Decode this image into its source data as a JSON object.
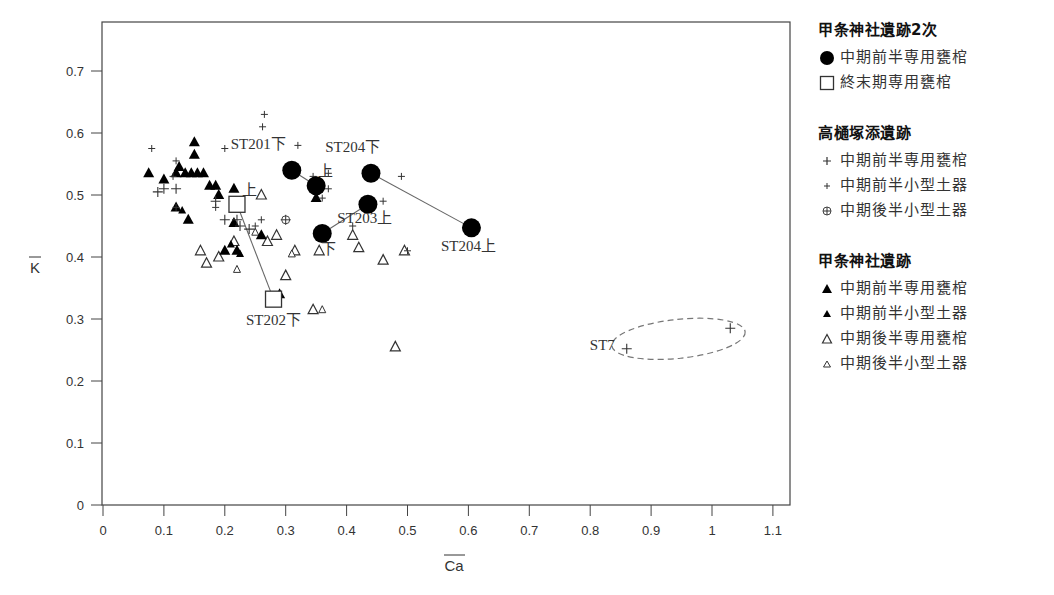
{
  "chart_data": {
    "type": "scatter",
    "title": "",
    "xlabel": "Ca",
    "ylabel": "K",
    "xlim": [
      0,
      1.17
    ],
    "ylim": [
      0,
      0.78
    ],
    "x_ticks": [
      "0",
      "0.1",
      "0.2",
      "0.3",
      "0.4",
      "0.5",
      "0.6",
      "0.7",
      "0.8",
      "0.9",
      "1",
      "1.1"
    ],
    "y_ticks": [
      "0",
      "0.1",
      "0.2",
      "0.3",
      "0.4",
      "0.5",
      "0.6",
      "0.7"
    ],
    "grid": false,
    "legend_position": "right",
    "series": [
      {
        "group": "甲条神社遺跡2次",
        "name": "中期前半専用甕棺",
        "marker": "filled-circle",
        "points": [
          [
            0.31,
            0.54
          ],
          [
            0.35,
            0.515
          ],
          [
            0.44,
            0.535
          ],
          [
            0.605,
            0.447
          ],
          [
            0.435,
            0.485
          ],
          [
            0.36,
            0.438
          ]
        ]
      },
      {
        "group": "甲条神社遺跡2次",
        "name": "終末期専用甕棺",
        "marker": "open-square",
        "points": [
          [
            0.22,
            0.485
          ],
          [
            0.28,
            0.332
          ]
        ]
      },
      {
        "group": "高樋塚添遺跡",
        "name": "中期前半専用甕棺",
        "marker": "plus-large",
        "points": [
          [
            0.09,
            0.505
          ],
          [
            0.1,
            0.51
          ],
          [
            0.12,
            0.51
          ],
          [
            0.185,
            0.49
          ],
          [
            0.2,
            0.46
          ],
          [
            0.22,
            0.46
          ],
          [
            0.225,
            0.45
          ],
          [
            0.24,
            0.445
          ],
          [
            0.86,
            0.252
          ],
          [
            1.03,
            0.285
          ]
        ]
      },
      {
        "group": "高樋塚添遺跡",
        "name": "中期前半小型土器",
        "marker": "plus-small",
        "points": [
          [
            0.08,
            0.575
          ],
          [
            0.2,
            0.575
          ],
          [
            0.12,
            0.555
          ],
          [
            0.115,
            0.53
          ],
          [
            0.12,
            0.48
          ],
          [
            0.185,
            0.48
          ],
          [
            0.265,
            0.63
          ],
          [
            0.262,
            0.61
          ],
          [
            0.32,
            0.58
          ],
          [
            0.345,
            0.53
          ],
          [
            0.37,
            0.535
          ],
          [
            0.37,
            0.51
          ],
          [
            0.36,
            0.495
          ],
          [
            0.49,
            0.53
          ],
          [
            0.26,
            0.46
          ],
          [
            0.41,
            0.45
          ],
          [
            0.46,
            0.49
          ],
          [
            0.5,
            0.41
          ],
          [
            0.25,
            0.45
          ]
        ]
      },
      {
        "group": "高樋塚添遺跡",
        "name": "中期後半小型土器",
        "marker": "plus-circle",
        "points": [
          [
            0.3,
            0.46
          ]
        ]
      },
      {
        "group": "甲条神社遺跡",
        "name": "中期前半専用甕棺",
        "marker": "filled-triangle",
        "points": [
          [
            0.075,
            0.535
          ],
          [
            0.1,
            0.525
          ],
          [
            0.12,
            0.535
          ],
          [
            0.125,
            0.545
          ],
          [
            0.135,
            0.535
          ],
          [
            0.145,
            0.535
          ],
          [
            0.15,
            0.585
          ],
          [
            0.15,
            0.565
          ],
          [
            0.155,
            0.535
          ],
          [
            0.165,
            0.535
          ],
          [
            0.175,
            0.515
          ],
          [
            0.185,
            0.515
          ],
          [
            0.19,
            0.5
          ],
          [
            0.2,
            0.41
          ],
          [
            0.215,
            0.51
          ],
          [
            0.215,
            0.455
          ],
          [
            0.22,
            0.41
          ],
          [
            0.14,
            0.46
          ],
          [
            0.12,
            0.48
          ],
          [
            0.35,
            0.495
          ],
          [
            0.29,
            0.34
          ],
          [
            0.26,
            0.435
          ]
        ]
      },
      {
        "group": "甲条神社遺跡",
        "name": "中期前半小型土器",
        "marker": "filled-triangle-small",
        "points": [
          [
            0.13,
            0.475
          ],
          [
            0.21,
            0.42
          ],
          [
            0.225,
            0.405
          ]
        ]
      },
      {
        "group": "甲条神社遺跡",
        "name": "中期後半専用甕棺",
        "marker": "open-triangle",
        "points": [
          [
            0.16,
            0.41
          ],
          [
            0.17,
            0.39
          ],
          [
            0.19,
            0.4
          ],
          [
            0.215,
            0.425
          ],
          [
            0.26,
            0.5
          ],
          [
            0.27,
            0.425
          ],
          [
            0.285,
            0.435
          ],
          [
            0.315,
            0.41
          ],
          [
            0.3,
            0.37
          ],
          [
            0.355,
            0.41
          ],
          [
            0.41,
            0.435
          ],
          [
            0.42,
            0.415
          ],
          [
            0.46,
            0.395
          ],
          [
            0.48,
            0.255
          ],
          [
            0.495,
            0.41
          ],
          [
            0.345,
            0.315
          ]
        ]
      },
      {
        "group": "甲条神社遺跡",
        "name": "中期後半小型土器",
        "marker": "open-triangle-small",
        "points": [
          [
            0.22,
            0.38
          ],
          [
            0.25,
            0.44
          ],
          [
            0.36,
            0.315
          ],
          [
            0.31,
            0.405
          ]
        ]
      }
    ],
    "connectors": [
      {
        "from": [
          0.31,
          0.54
        ],
        "to": [
          0.35,
          0.515
        ]
      },
      {
        "from": [
          0.44,
          0.535
        ],
        "to": [
          0.605,
          0.447
        ]
      },
      {
        "from": [
          0.36,
          0.438
        ],
        "to": [
          0.435,
          0.485
        ]
      },
      {
        "from": [
          0.22,
          0.485
        ],
        "to": [
          0.28,
          0.332
        ]
      }
    ],
    "annotations": [
      {
        "text": "ST201下",
        "x": 0.255,
        "y": 0.575
      },
      {
        "text": "上",
        "x": 0.365,
        "y": 0.53
      },
      {
        "text": "ST204下",
        "x": 0.41,
        "y": 0.57
      },
      {
        "text": "ST203上",
        "x": 0.43,
        "y": 0.455
      },
      {
        "text": "下",
        "x": 0.37,
        "y": 0.405
      },
      {
        "text": "ST204上",
        "x": 0.6,
        "y": 0.41
      },
      {
        "text": "上",
        "x": 0.24,
        "y": 0.5
      },
      {
        "text": "ST202下",
        "x": 0.28,
        "y": 0.29
      },
      {
        "text": "ST7",
        "x": 0.82,
        "y": 0.25
      }
    ],
    "ellipse": {
      "cx": 0.945,
      "cy": 0.268,
      "rx": 0.11,
      "ry": 0.025,
      "style": "dashed"
    }
  },
  "legend": {
    "groups": [
      {
        "title": "甲条神社遺跡2次",
        "items": [
          {
            "symbol": "filled-circle",
            "label": "中期前半専用甕棺"
          },
          {
            "symbol": "open-square",
            "label": "終末期専用甕棺"
          }
        ]
      },
      {
        "title": "高樋塚添遺跡",
        "items": [
          {
            "symbol": "plus-large",
            "label": "中期前半専用甕棺"
          },
          {
            "symbol": "plus-small",
            "label": "中期前半小型土器"
          },
          {
            "symbol": "plus-circle",
            "label": "中期後半小型土器"
          }
        ]
      },
      {
        "title": "甲条神社遺跡",
        "items": [
          {
            "symbol": "filled-triangle",
            "label": "中期前半専用甕棺"
          },
          {
            "symbol": "filled-triangle-small",
            "label": "中期前半小型土器"
          },
          {
            "symbol": "open-triangle",
            "label": "中期後半専用甕棺"
          },
          {
            "symbol": "open-triangle-small",
            "label": "中期後半小型土器"
          }
        ]
      }
    ]
  }
}
